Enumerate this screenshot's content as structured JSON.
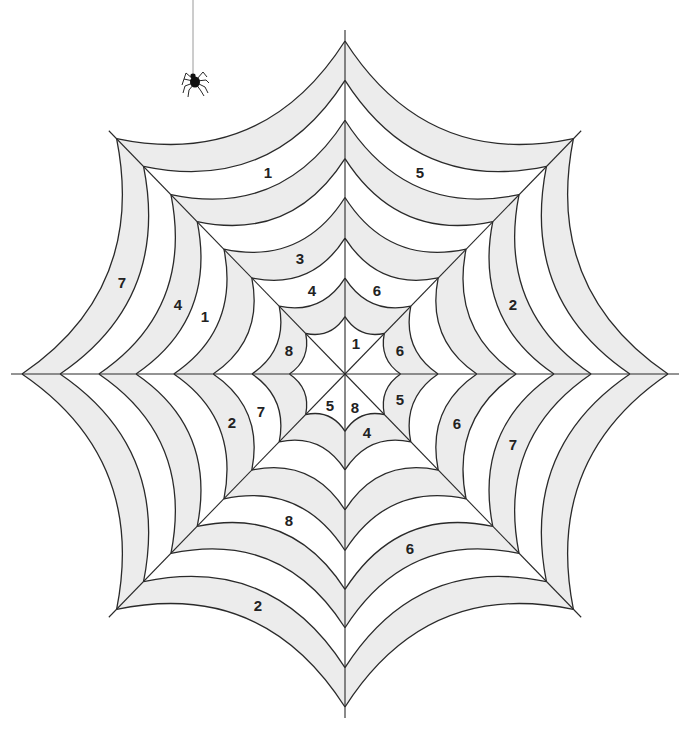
{
  "canvas": {
    "width": 690,
    "height": 733,
    "background": "#ffffff"
  },
  "web": {
    "center": {
      "x": 345,
      "y": 374
    },
    "radius_x": 323,
    "radius_y": 333,
    "spoke_count": 8,
    "spoke_overhang": 11,
    "ring_fractions": [
      1.0,
      0.882,
      0.762,
      0.647,
      0.53,
      0.408,
      0.288,
      0.172
    ],
    "sag": 0.14,
    "colors": {
      "line": "#2a2a2a",
      "band_shaded": "#ececec",
      "band_plain": "#ffffff"
    },
    "band_fill_pattern": [
      "shaded",
      "plain",
      "shaded",
      "plain",
      "shaded",
      "plain",
      "shaded",
      "plain"
    ]
  },
  "spider": {
    "thread_x": 193,
    "thread_top": 0,
    "thread_bottom": 74,
    "thread_color": "#9a9a9a",
    "body": {
      "x": 195,
      "y": 81
    },
    "color": "#111111"
  },
  "labels": [
    {
      "text": "1",
      "x": 268,
      "y": 172
    },
    {
      "text": "5",
      "x": 420,
      "y": 172
    },
    {
      "text": "7",
      "x": 122,
      "y": 282
    },
    {
      "text": "4",
      "x": 178,
      "y": 304
    },
    {
      "text": "1",
      "x": 205,
      "y": 316
    },
    {
      "text": "3",
      "x": 300,
      "y": 258
    },
    {
      "text": "4",
      "x": 312,
      "y": 290
    },
    {
      "text": "6",
      "x": 377,
      "y": 290
    },
    {
      "text": "2",
      "x": 513,
      "y": 304
    },
    {
      "text": "8",
      "x": 289,
      "y": 350
    },
    {
      "text": "1",
      "x": 356,
      "y": 343
    },
    {
      "text": "6",
      "x": 400,
      "y": 350
    },
    {
      "text": "2",
      "x": 232,
      "y": 422
    },
    {
      "text": "7",
      "x": 261,
      "y": 411
    },
    {
      "text": "5",
      "x": 330,
      "y": 405
    },
    {
      "text": "8",
      "x": 355,
      "y": 407
    },
    {
      "text": "5",
      "x": 400,
      "y": 399
    },
    {
      "text": "4",
      "x": 367,
      "y": 432
    },
    {
      "text": "6",
      "x": 457,
      "y": 423
    },
    {
      "text": "7",
      "x": 513,
      "y": 444
    },
    {
      "text": "8",
      "x": 289,
      "y": 520
    },
    {
      "text": "6",
      "x": 410,
      "y": 548
    },
    {
      "text": "2",
      "x": 258,
      "y": 605
    }
  ]
}
